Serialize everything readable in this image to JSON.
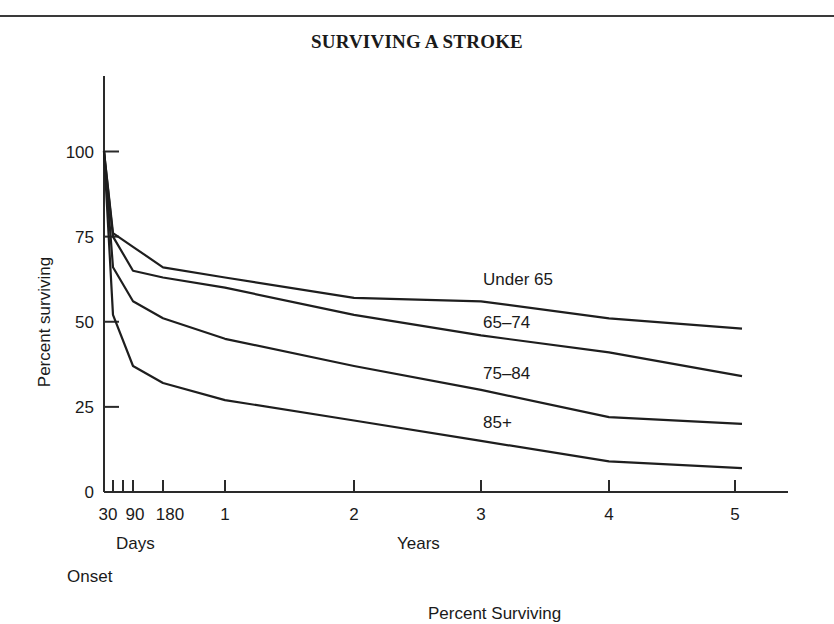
{
  "page": {
    "title": "SURVIVING A STROKE",
    "bottom_caption_partial": "Percent Surviving"
  },
  "chart_data": {
    "type": "line",
    "title": "SURVIVING A STROKE",
    "xlabel_days": "Days",
    "xlabel_years": "Years",
    "xlabel_origin": "Onset",
    "ylabel": "Percent surviving",
    "ylim": [
      0,
      100
    ],
    "grid": false,
    "legend_position": "inline labels at right",
    "y_ticks": [
      0,
      25,
      50,
      75,
      100
    ],
    "x_ticks": [
      {
        "label": "30",
        "unit": "days"
      },
      {
        "label": "",
        "unit": "days",
        "value": 60
      },
      {
        "label": "90",
        "unit": "days"
      },
      {
        "label": "180",
        "unit": "days"
      },
      {
        "label": "1",
        "unit": "years"
      },
      {
        "label": "2",
        "unit": "years"
      },
      {
        "label": "3",
        "unit": "years"
      },
      {
        "label": "4",
        "unit": "years"
      },
      {
        "label": "5",
        "unit": "years"
      }
    ],
    "x": [
      "Onset",
      "30 days",
      "90 days",
      "180 days",
      "1 yr",
      "2 yr",
      "3 yr",
      "4 yr",
      "5 yr"
    ],
    "series": [
      {
        "name": "Under 65",
        "values": [
          100,
          76,
          72,
          66,
          63,
          57,
          56,
          51,
          48
        ]
      },
      {
        "name": "65–74",
        "values": [
          100,
          75,
          65,
          63,
          60,
          52,
          46,
          41,
          34
        ]
      },
      {
        "name": "75–84",
        "values": [
          100,
          66,
          56,
          51,
          45,
          37,
          30,
          22,
          20
        ]
      },
      {
        "name": "85+",
        "values": [
          100,
          52,
          37,
          32,
          27,
          21,
          15,
          9,
          7
        ]
      }
    ]
  }
}
